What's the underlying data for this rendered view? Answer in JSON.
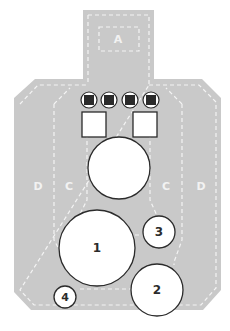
{
  "target": {
    "type": "ipsc-style-silhouette",
    "colors": {
      "background": "#ffffff",
      "silhouette": "#c9c9c9",
      "dash_lines": "#f4f4f4",
      "plate_fill": "#ffffff",
      "plate_stroke": "#2b2b2b",
      "popper_core": "#2a2a2a"
    },
    "zones": {
      "head": "A",
      "left_outer": "D",
      "left_inner": "C",
      "right_inner": "C",
      "right_outer": "D"
    },
    "poppers": [
      {
        "id": "popper-1"
      },
      {
        "id": "popper-2"
      },
      {
        "id": "popper-3"
      },
      {
        "id": "popper-4"
      }
    ],
    "squares": [
      {
        "id": "square-left"
      },
      {
        "id": "square-right"
      }
    ],
    "center_plate": {
      "label": ""
    },
    "numbered_plates": [
      {
        "label": "1"
      },
      {
        "label": "2"
      },
      {
        "label": "3"
      },
      {
        "label": "4"
      }
    ]
  }
}
